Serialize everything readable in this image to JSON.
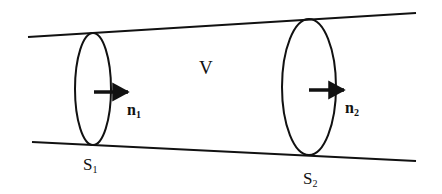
{
  "diagram": {
    "volume_label": "V",
    "surface1": {
      "label": "S",
      "subscript": "1"
    },
    "surface2": {
      "label": "S",
      "subscript": "2"
    },
    "normal1": {
      "label": "n",
      "subscript": "1"
    },
    "normal2": {
      "label": "n",
      "subscript": "2"
    },
    "stroke_color": "#111111"
  }
}
